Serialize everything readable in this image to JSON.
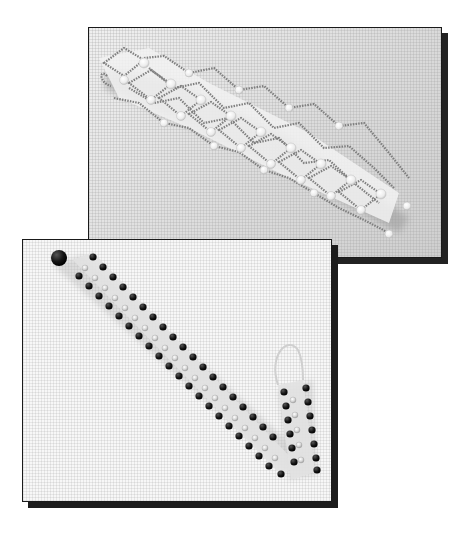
{
  "scene": {
    "description": "Two overlapping photographs of beaded bracelets on a fine grid-textured background",
    "photos": [
      {
        "id": "top",
        "subject": "lace-style bracelet with pearl and silver seed beads in a diamond netting pattern",
        "background": "light gray textured canvas",
        "colors": {
          "background": "#e4e4e4",
          "pearls": "#f4f4f4",
          "seed_beads": "#8a8a8a",
          "shadow": "#222222"
        }
      },
      {
        "id": "bottom",
        "subject": "two-row bracelet with dark beads along the edges and clear crystal beads in the center, with a button-bead clasp and a loop end",
        "background": "white textured canvas",
        "colors": {
          "background": "#f7f7f7",
          "dark_beads": "#1a1a1a",
          "crystal_beads": "#d8d8d8",
          "shadow": "#1c1c1c"
        }
      }
    ]
  }
}
